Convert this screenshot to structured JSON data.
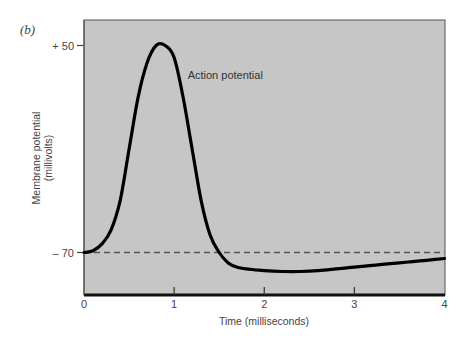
{
  "panel_label": "(b)",
  "chart_data": {
    "type": "line",
    "title": "",
    "xlabel": "Time (milliseconds)",
    "ylabel": "Membrane potential (millivolts)",
    "ylabel_lines": [
      "Membrane potential",
      "(millivolts)"
    ],
    "xlim": [
      0,
      4
    ],
    "ylim": [
      -84,
      67
    ],
    "x_ticks": [
      0,
      1,
      2,
      3,
      4
    ],
    "x_tick_labels": [
      "0",
      "1",
      "2",
      "3",
      "4"
    ],
    "y_ticks": [
      50,
      -70
    ],
    "y_tick_labels": [
      "+ 50",
      "– 70"
    ],
    "grid": false,
    "legend": null,
    "annotations": [
      {
        "text": "Action potential",
        "x": 1.15,
        "y": 33
      }
    ],
    "reference_lines": [
      {
        "type": "horizontal",
        "y": -70,
        "style": "dashed",
        "label": "resting potential"
      }
    ],
    "series": [
      {
        "name": "Action potential",
        "x": [
          0,
          0.1,
          0.2,
          0.3,
          0.4,
          0.5,
          0.6,
          0.7,
          0.8,
          0.9,
          1.0,
          1.1,
          1.2,
          1.3,
          1.4,
          1.5,
          1.6,
          1.7,
          1.8,
          1.9,
          2.0,
          2.2,
          2.4,
          2.6,
          2.8,
          3.0,
          3.2,
          3.4,
          3.6,
          3.8,
          4.0
        ],
        "y": [
          -70,
          -69,
          -65,
          -57,
          -40,
          -10,
          20,
          40,
          50,
          50,
          43,
          20,
          -10,
          -40,
          -60,
          -70,
          -76,
          -78.5,
          -79.5,
          -80,
          -80.5,
          -81,
          -81,
          -80.5,
          -79.5,
          -78.5,
          -77.5,
          -76.5,
          -75.5,
          -74.5,
          -73.5
        ]
      }
    ]
  },
  "colors": {
    "plot_background": "#c6c6c6",
    "axis": "#222222",
    "curve": "#000000",
    "dashed_line": "#555555"
  }
}
